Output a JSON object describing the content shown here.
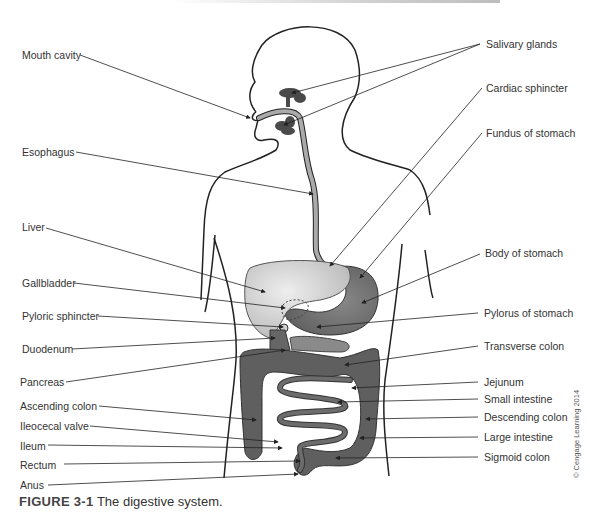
{
  "figure": {
    "number": "FIGURE 3-1",
    "caption": "The digestive system.",
    "copyright": "© Cengage Learning 2014"
  },
  "labels_left": [
    {
      "id": "mouth-cavity",
      "text": "Mouth cavity"
    },
    {
      "id": "esophagus",
      "text": "Esophagus"
    },
    {
      "id": "liver",
      "text": "Liver"
    },
    {
      "id": "gallbladder",
      "text": "Gallbladder"
    },
    {
      "id": "pyloric-sphincter",
      "text": "Pyloric sphincter"
    },
    {
      "id": "duodenum",
      "text": "Duodenum"
    },
    {
      "id": "pancreas",
      "text": "Pancreas"
    },
    {
      "id": "ascending-colon",
      "text": "Ascending colon"
    },
    {
      "id": "ileocecal-valve",
      "text": "Ileocecal valve"
    },
    {
      "id": "ileum",
      "text": "Ileum"
    },
    {
      "id": "rectum",
      "text": "Rectum"
    },
    {
      "id": "anus",
      "text": "Anus"
    }
  ],
  "labels_right": [
    {
      "id": "salivary-glands",
      "text": "Salivary glands"
    },
    {
      "id": "cardiac-sphincter",
      "text": "Cardiac sphincter"
    },
    {
      "id": "fundus-of-stomach",
      "text": "Fundus of stomach"
    },
    {
      "id": "body-of-stomach",
      "text": "Body of stomach"
    },
    {
      "id": "pylorus-of-stomach",
      "text": "Pylorus of stomach"
    },
    {
      "id": "transverse-colon",
      "text": "Transverse colon"
    },
    {
      "id": "jejunum",
      "text": "Jejunum"
    },
    {
      "id": "small-intestine",
      "text": "Small intestine"
    },
    {
      "id": "descending-colon",
      "text": "Descending colon"
    },
    {
      "id": "large-intestine",
      "text": "Large intestine"
    },
    {
      "id": "sigmoid-colon",
      "text": "Sigmoid colon"
    }
  ],
  "colors": {
    "outline": "#222222",
    "esophagus": "#a9a9a9",
    "liver": "#d4d4d4",
    "stomach": "#7c7c7c",
    "intestine": "#5f5f5f",
    "gland": "#4a4a4a"
  }
}
